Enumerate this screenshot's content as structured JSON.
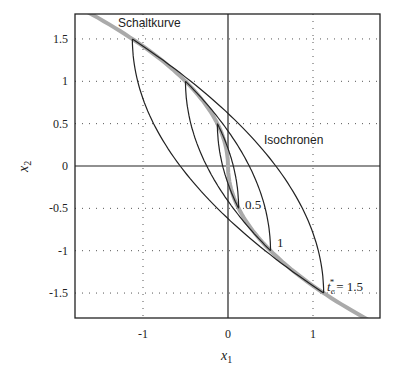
{
  "chart_data": {
    "type": "line",
    "title": "",
    "xlabel": "x1",
    "ylabel": "x2",
    "xlim": [
      -1.8,
      1.8
    ],
    "ylim": [
      -1.8,
      1.8
    ],
    "xticks": [
      -1,
      0,
      1
    ],
    "xtick_labels": [
      "-1",
      "0",
      "1"
    ],
    "yticks": [
      1.5,
      1,
      0.5,
      0,
      -0.5,
      -1,
      -1.5
    ],
    "ytick_labels": [
      "1.5",
      "1",
      "0.5",
      "0",
      "-0.5",
      "-1",
      "-1.5"
    ],
    "grid": "dotted",
    "switching_curve": {
      "name": "Schaltkurve",
      "equation": "x1 = -x2*|x2|/2",
      "color": "#aaaaaa"
    },
    "isochrones": {
      "name": "Isochronen",
      "times": [
        0.5,
        1,
        1.5
      ],
      "color": "#222222"
    },
    "annotations": [
      {
        "text": "Schaltkurve",
        "x": -0.85,
        "y": 1.65
      },
      {
        "text": "Isochronen",
        "x": 0.4,
        "y": 0.35
      },
      {
        "text": "0.5",
        "x": 0.2,
        "y": -0.38
      },
      {
        "text": "1",
        "x": 0.55,
        "y": -0.9
      },
      {
        "text": "t_e* = 1.5",
        "x": 1.15,
        "y": -1.38
      }
    ]
  },
  "labels": {
    "x_axis": "x",
    "x_axis_sub": "1",
    "y_axis": "x",
    "y_axis_sub": "2",
    "schaltkurve": "Schaltkurve",
    "isochronen": "Isochronen",
    "iso_05": "0.5",
    "iso_1": "1",
    "iso_15_t": "t",
    "iso_15_sub": "e",
    "iso_15_sup": "*",
    "iso_15_val": "= 1.5"
  }
}
